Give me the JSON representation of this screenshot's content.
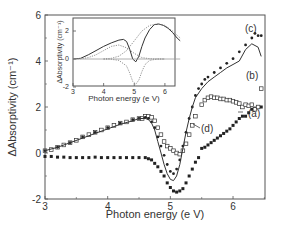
{
  "chart_data": [
    {
      "type": "line",
      "role": "main",
      "title": "",
      "xlabel": "Photon  energy  (e V)",
      "ylabel": "ΔAbsorptivity  (cm⁻¹)",
      "xlim": [
        3,
        6.5
      ],
      "ylim": [
        -2,
        6
      ],
      "xticks": [
        3,
        4,
        5,
        6
      ],
      "yticks": [
        -2,
        0,
        2,
        4,
        6
      ],
      "grid": false,
      "series": [
        {
          "name": "(a)",
          "style": "filled-square-markers",
          "x": [
            3.0,
            3.1,
            3.2,
            3.3,
            3.4,
            3.5,
            3.6,
            3.7,
            3.8,
            3.9,
            4.0,
            4.1,
            4.2,
            4.3,
            4.4,
            4.5,
            4.6,
            4.65,
            4.7,
            4.75,
            4.8,
            4.85,
            4.9,
            4.95,
            5.0,
            5.05,
            5.1,
            5.15,
            5.2,
            5.25,
            5.3,
            5.35,
            5.4,
            5.45,
            5.5,
            5.55,
            5.6,
            5.65,
            5.7,
            5.75,
            5.8,
            5.85,
            5.9,
            5.95,
            6.0,
            6.05,
            6.1,
            6.15,
            6.2,
            6.25,
            6.3,
            6.35,
            6.4,
            6.45
          ],
          "y": [
            -0.15,
            -0.15,
            -0.18,
            -0.18,
            -0.2,
            -0.2,
            -0.2,
            -0.2,
            -0.18,
            -0.2,
            -0.2,
            -0.2,
            -0.2,
            -0.2,
            -0.2,
            -0.2,
            -0.2,
            -0.25,
            -0.3,
            -0.45,
            -0.6,
            -0.8,
            -1.0,
            -1.3,
            -1.5,
            -1.65,
            -1.7,
            -1.65,
            -1.55,
            -1.3,
            -1.0,
            -0.7,
            -0.4,
            -0.2,
            0.2,
            0.25,
            0.35,
            0.45,
            0.55,
            0.65,
            0.75,
            0.85,
            0.95,
            1.05,
            1.2,
            1.35,
            1.5,
            1.6,
            1.6,
            1.75,
            1.9,
            1.95,
            2.0,
            2.0
          ]
        },
        {
          "name": "(b)",
          "style": "open-square-markers",
          "x": [
            3.0,
            3.1,
            3.2,
            3.3,
            3.4,
            3.5,
            3.6,
            3.7,
            3.8,
            3.9,
            4.0,
            4.1,
            4.2,
            4.3,
            4.4,
            4.5,
            4.55,
            4.6,
            4.65,
            4.7,
            4.75,
            4.8,
            4.85,
            4.9,
            4.95,
            5.0,
            5.05,
            5.1,
            5.15,
            5.2,
            5.25,
            5.3,
            5.35,
            5.4,
            5.5,
            5.55,
            5.6,
            5.65,
            5.7,
            5.75,
            5.8,
            5.85,
            5.9,
            5.95,
            6.0,
            6.05,
            6.1,
            6.15,
            6.2,
            6.25,
            6.3,
            6.35,
            6.4,
            6.45
          ],
          "y": [
            0.1,
            0.15,
            0.25,
            0.35,
            0.45,
            0.55,
            0.7,
            0.8,
            0.9,
            1.0,
            1.1,
            1.2,
            1.3,
            1.35,
            1.45,
            1.5,
            1.5,
            1.6,
            1.6,
            1.55,
            1.4,
            1.1,
            0.8,
            0.5,
            0.3,
            0.2,
            0.1,
            0.0,
            -0.05,
            0.1,
            0.4,
            0.8,
            1.2,
            1.6,
            2.1,
            2.3,
            2.4,
            2.45,
            2.4,
            2.4,
            2.35,
            2.35,
            2.3,
            2.3,
            2.25,
            2.2,
            2.15,
            2.0,
            2.1,
            2.05,
            2.1,
            1.9,
            2.0,
            2.8
          ]
        },
        {
          "name": "(c)",
          "style": "filled-circle-markers",
          "x": [
            3.0,
            3.2,
            3.4,
            3.6,
            3.8,
            4.0,
            4.2,
            4.4,
            4.5,
            4.6,
            4.65,
            4.7,
            4.75,
            4.8,
            4.85,
            4.9,
            4.95,
            5.0,
            5.05,
            5.1,
            5.15,
            5.2,
            5.25,
            5.3,
            5.35,
            5.4,
            5.45,
            5.5,
            5.55,
            5.6,
            5.7,
            5.8,
            5.9,
            6.0,
            6.1,
            6.2,
            6.3,
            6.35,
            6.4,
            6.45
          ],
          "y": [
            0.1,
            0.25,
            0.45,
            0.7,
            0.9,
            1.1,
            1.3,
            1.45,
            1.5,
            1.55,
            1.5,
            1.35,
            1.1,
            0.7,
            0.3,
            -0.1,
            -0.5,
            -0.8,
            -0.9,
            -0.7,
            -0.3,
            0.3,
            0.9,
            1.5,
            2.0,
            2.5,
            2.8,
            3.0,
            3.2,
            3.3,
            3.5,
            3.7,
            3.9,
            4.1,
            4.4,
            4.7,
            5.0,
            5.2,
            5.1,
            5.1
          ]
        },
        {
          "name": "(d)",
          "style": "solid-line",
          "x": [
            3.0,
            3.2,
            3.4,
            3.6,
            3.8,
            4.0,
            4.2,
            4.4,
            4.5,
            4.6,
            4.65,
            4.7,
            4.75,
            4.8,
            4.85,
            4.9,
            4.95,
            5.0,
            5.05,
            5.1,
            5.15,
            5.2,
            5.25,
            5.3,
            5.35,
            5.4,
            5.5,
            5.6,
            5.7,
            5.8,
            5.9,
            6.0,
            6.1,
            6.2,
            6.3,
            6.4,
            6.45
          ],
          "y": [
            0.1,
            0.25,
            0.45,
            0.65,
            0.85,
            1.05,
            1.25,
            1.4,
            1.5,
            1.5,
            1.45,
            1.3,
            1.0,
            0.5,
            0.0,
            -0.5,
            -0.9,
            -1.15,
            -1.2,
            -1.0,
            -0.5,
            0.2,
            0.9,
            1.5,
            2.0,
            2.4,
            2.8,
            3.1,
            3.3,
            3.5,
            3.7,
            3.85,
            4.0,
            4.5,
            4.75,
            4.6,
            4.2
          ]
        }
      ],
      "annotations": [
        "(a)",
        "(b)",
        "(c)",
        "(d)"
      ]
    },
    {
      "type": "line",
      "role": "inset",
      "title": "",
      "xlabel": "Photon  energy  (e V)",
      "ylabel": "ΔAbsorptivity  (cm⁻¹)",
      "xlim": [
        3,
        6.5
      ],
      "ylim": [
        -2,
        3
      ],
      "xticks": [
        3,
        4,
        5,
        6
      ],
      "yticks": [
        -2,
        0,
        2
      ],
      "grid": false,
      "series": [
        {
          "name": "total",
          "style": "solid-line",
          "x": [
            3.0,
            3.25,
            3.5,
            3.75,
            4.0,
            4.25,
            4.5,
            4.65,
            4.75,
            4.85,
            4.95,
            5.05,
            5.15,
            5.25,
            5.35,
            5.5,
            5.65,
            5.8,
            5.95,
            6.1,
            6.25,
            6.4,
            6.5
          ],
          "y": [
            0.0,
            0.05,
            0.3,
            0.6,
            0.9,
            1.15,
            1.35,
            1.4,
            1.25,
            0.7,
            0.0,
            -0.2,
            0.2,
            0.9,
            1.5,
            2.1,
            2.45,
            2.5,
            2.4,
            2.2,
            1.9,
            1.5,
            1.3
          ]
        },
        {
          "name": "band-1",
          "style": "dotted-line",
          "x": [
            3.0,
            3.25,
            3.5,
            3.75,
            4.0,
            4.25,
            4.5,
            4.75,
            5.0,
            5.25,
            5.5,
            5.75,
            6.0
          ],
          "y": [
            0.0,
            0.02,
            0.1,
            0.3,
            0.6,
            0.9,
            1.0,
            0.8,
            0.4,
            0.1,
            0.02,
            0.0,
            0.0
          ]
        },
        {
          "name": "band-2",
          "style": "dotted-line",
          "x": [
            4.0,
            4.25,
            4.5,
            4.75,
            4.85,
            4.95,
            5.05,
            5.15,
            5.25,
            5.35,
            5.5,
            5.75,
            6.0
          ],
          "y": [
            0.0,
            -0.02,
            -0.1,
            -0.5,
            -1.0,
            -1.6,
            -1.8,
            -1.5,
            -0.9,
            -0.4,
            -0.1,
            0.0,
            0.0
          ]
        },
        {
          "name": "band-3",
          "style": "dotted-line",
          "x": [
            4.0,
            4.25,
            4.5,
            4.75,
            5.0,
            5.25,
            5.5,
            5.75,
            6.0,
            6.25,
            6.5
          ],
          "y": [
            0.0,
            0.05,
            0.2,
            0.6,
            1.3,
            2.0,
            2.4,
            2.5,
            2.4,
            2.0,
            1.5
          ]
        },
        {
          "name": "baseline",
          "style": "solid-line",
          "x": [
            3.0,
            6.5
          ],
          "y": [
            0.0,
            0.0
          ]
        }
      ]
    }
  ]
}
